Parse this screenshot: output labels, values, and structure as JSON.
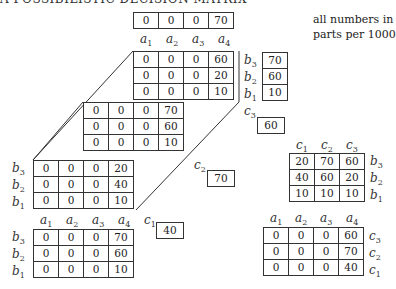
{
  "title": "A POSSIBILISTIC DECISION MATRIX",
  "note": [
    "all numbers in",
    "parts per 1000"
  ],
  "a_labels": [
    "a1",
    "a2",
    "a3",
    "a4"
  ],
  "b_labels": [
    "b3",
    "b2",
    "b1"
  ],
  "c_labels": [
    "c1",
    "c2",
    "c3"
  ],
  "top_row": {
    "values": [
      0,
      0,
      0,
      70
    ]
  },
  "cube": {
    "c3_face": [
      [
        0,
        0,
        0,
        60
      ],
      [
        0,
        0,
        0,
        20
      ],
      [
        0,
        0,
        0,
        10
      ]
    ],
    "c2_face": [
      [
        0,
        0,
        0,
        70
      ],
      [
        0,
        0,
        0,
        60
      ],
      [
        0,
        0,
        0,
        10
      ]
    ],
    "c1_face": [
      [
        0,
        0,
        0,
        20
      ],
      [
        0,
        0,
        0,
        40
      ],
      [
        0,
        0,
        0,
        10
      ]
    ]
  },
  "b_column": [
    70,
    60,
    10
  ],
  "c_max": {
    "c3": 60,
    "c2": 70,
    "c1": 40
  },
  "ab_projection": [
    [
      0,
      0,
      0,
      70
    ],
    [
      0,
      0,
      0,
      60
    ],
    [
      0,
      0,
      0,
      10
    ]
  ],
  "cb_projection": {
    "headers": [
      "c1",
      "c2",
      "c3"
    ],
    "rows": [
      [
        20,
        70,
        60
      ],
      [
        40,
        60,
        20
      ],
      [
        10,
        10,
        10
      ]
    ],
    "row_labels": [
      "b3",
      "b2",
      "b1"
    ]
  },
  "ac_projection": {
    "headers": [
      "a1",
      "a2",
      "a3",
      "a4"
    ],
    "rows": [
      [
        0,
        0,
        0,
        60
      ],
      [
        0,
        0,
        0,
        70
      ],
      [
        0,
        0,
        0,
        40
      ]
    ],
    "row_labels": [
      "c3",
      "c2",
      "c1"
    ]
  }
}
